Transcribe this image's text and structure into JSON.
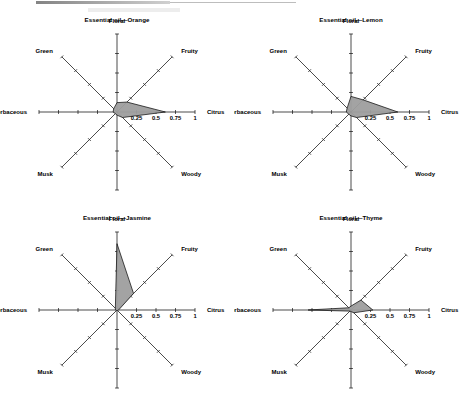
{
  "figure": {
    "panel_count": 4,
    "axis_labels": [
      "Floral",
      "Fruity",
      "Citrus",
      "Woody",
      "Oriental",
      "Musk",
      "Herbaceous",
      "Green"
    ],
    "tick_labels": [
      "0.25",
      "0.5",
      "0.75",
      "1"
    ],
    "colors": {
      "fill": "#9e9e9e",
      "stroke": "#1a1a1a",
      "axis": "#2b2b2b",
      "text": "#000000",
      "background": "#ffffff"
    }
  },
  "panels": [
    {
      "title": "Essential oil—Orange"
    },
    {
      "title": "Essential oil—Lemon"
    },
    {
      "title": "Essential oil—Jasmine"
    },
    {
      "title": "Essential oil—Thyme"
    }
  ],
  "chart_data": [
    {
      "type": "radar",
      "title": "Essential oil—Orange",
      "categories": [
        "Floral",
        "Fruity",
        "Citrus",
        "Woody",
        "Oriental",
        "Musk",
        "Herbaceous",
        "Green"
      ],
      "values": [
        0.12,
        0.18,
        0.62,
        0.1,
        0.04,
        0.03,
        0.05,
        0.06
      ],
      "rlim": [
        0,
        1
      ],
      "tick_labels": [
        "0.25",
        "0.5",
        "0.75",
        "1"
      ],
      "ticks": [
        0.25,
        0.5,
        0.75,
        1
      ],
      "grid": false,
      "legend": "none",
      "xlabel": "",
      "ylabel": ""
    },
    {
      "type": "radar",
      "title": "Essential oil—Lemon",
      "categories": [
        "Floral",
        "Fruity",
        "Citrus",
        "Woody",
        "Oriental",
        "Musk",
        "Herbaceous",
        "Green"
      ],
      "values": [
        0.2,
        0.22,
        0.6,
        0.1,
        0.05,
        0.04,
        0.06,
        0.07
      ],
      "rlim": [
        0,
        1
      ],
      "tick_labels": [
        "0.25",
        "0.5",
        "0.75",
        "1"
      ],
      "ticks": [
        0.25,
        0.5,
        0.75,
        1
      ],
      "grid": false,
      "legend": "none",
      "xlabel": "",
      "ylabel": ""
    },
    {
      "type": "radar",
      "title": "Essential oil—Jasmine",
      "categories": [
        "Floral",
        "Fruity",
        "Citrus",
        "Woody",
        "Oriental",
        "Musk",
        "Herbaceous",
        "Green"
      ],
      "values": [
        0.85,
        0.3,
        0.02,
        0.01,
        0.01,
        0.01,
        0.02,
        0.03
      ],
      "rlim": [
        0,
        1
      ],
      "tick_labels": [
        "0.25",
        "0.5",
        "0.75",
        "1"
      ],
      "ticks": [
        0.25,
        0.5,
        0.75,
        1
      ],
      "grid": false,
      "legend": "none",
      "xlabel": "",
      "ylabel": ""
    },
    {
      "type": "radar",
      "title": "Essential oil—Thyme",
      "categories": [
        "Floral",
        "Fruity",
        "Citrus",
        "Woody",
        "Oriental",
        "Musk",
        "Herbaceous",
        "Green"
      ],
      "values": [
        0.05,
        0.18,
        0.28,
        0.05,
        0.02,
        0.02,
        0.55,
        0.04
      ],
      "rlim": [
        0,
        1
      ],
      "tick_labels": [
        "0.25",
        "0.5",
        "0.75",
        "1"
      ],
      "ticks": [
        0.25,
        0.5,
        0.75,
        1
      ],
      "grid": false,
      "legend": "none",
      "xlabel": "",
      "ylabel": ""
    }
  ]
}
